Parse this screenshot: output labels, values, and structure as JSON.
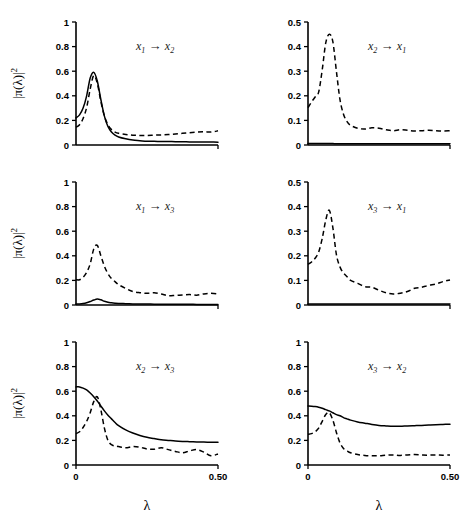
{
  "figure": {
    "xlabel": "λ",
    "ylabel_parts": {
      "bar": "|",
      "pi": "π(λ)",
      "bar2": "|",
      "exp": "2"
    },
    "arrow": "→"
  },
  "chart_data": [
    {
      "type": "line",
      "panel": "top-left",
      "title": "x1 → x2",
      "source": "x",
      "source_sub": "1",
      "target": "x",
      "target_sub": "2",
      "xlabel": "λ",
      "ylabel": "|π(λ)|²",
      "xlim": [
        0,
        0.5
      ],
      "ylim": [
        0,
        1
      ],
      "xticks": [
        0,
        0.5
      ],
      "xticklabels": [
        "0",
        "0.50"
      ],
      "yticks": [
        0,
        0.2,
        0.4,
        0.6,
        0.8,
        1
      ],
      "yticklabels": [
        "0",
        "0.2",
        "0.4",
        "0.6",
        "0.8",
        "1"
      ],
      "grid": false,
      "legend": false,
      "x": [
        0,
        0.0125,
        0.025,
        0.0375,
        0.05,
        0.0625,
        0.075,
        0.0875,
        0.1,
        0.1125,
        0.125,
        0.1375,
        0.15,
        0.175,
        0.2,
        0.225,
        0.25,
        0.275,
        0.3,
        0.325,
        0.35,
        0.375,
        0.4,
        0.425,
        0.45,
        0.475,
        0.5
      ],
      "series": [
        {
          "name": "solid",
          "style": "solid",
          "values": [
            0.22,
            0.245,
            0.3,
            0.4,
            0.545,
            0.59,
            0.52,
            0.37,
            0.235,
            0.15,
            0.105,
            0.08,
            0.065,
            0.05,
            0.04,
            0.035,
            0.03,
            0.03,
            0.028,
            0.028,
            0.027,
            0.026,
            0.025,
            0.025,
            0.024,
            0.024,
            0.023
          ]
        },
        {
          "name": "dashed",
          "style": "dashed",
          "values": [
            0.145,
            0.165,
            0.215,
            0.305,
            0.455,
            0.565,
            0.5,
            0.355,
            0.235,
            0.165,
            0.125,
            0.105,
            0.095,
            0.085,
            0.08,
            0.078,
            0.078,
            0.08,
            0.082,
            0.085,
            0.09,
            0.095,
            0.1,
            0.105,
            0.108,
            0.105,
            0.115
          ]
        }
      ]
    },
    {
      "type": "line",
      "panel": "top-right",
      "title": "x2 → x1",
      "source": "x",
      "source_sub": "2",
      "target": "x",
      "target_sub": "1",
      "xlabel": "λ",
      "ylabel": "",
      "xlim": [
        0,
        0.5
      ],
      "ylim": [
        0,
        0.5
      ],
      "xticks": [
        0,
        0.5
      ],
      "xticklabels": [
        "0",
        "0.50"
      ],
      "yticks": [
        0,
        0.1,
        0.2,
        0.3,
        0.4,
        0.5
      ],
      "yticklabels": [
        "0",
        "0.1",
        "0.2",
        "0.3",
        "0.4",
        "0.5"
      ],
      "grid": false,
      "legend": false,
      "x": [
        0,
        0.0125,
        0.025,
        0.0375,
        0.05,
        0.0625,
        0.075,
        0.0875,
        0.1,
        0.1125,
        0.125,
        0.1375,
        0.15,
        0.175,
        0.2,
        0.225,
        0.25,
        0.275,
        0.3,
        0.325,
        0.35,
        0.375,
        0.4,
        0.425,
        0.45,
        0.475,
        0.5
      ],
      "series": [
        {
          "name": "dashed",
          "style": "dashed",
          "values": [
            0.152,
            0.175,
            0.195,
            0.215,
            0.305,
            0.415,
            0.45,
            0.42,
            0.3,
            0.185,
            0.125,
            0.095,
            0.08,
            0.068,
            0.065,
            0.07,
            0.068,
            0.062,
            0.058,
            0.062,
            0.06,
            0.057,
            0.058,
            0.06,
            0.058,
            0.057,
            0.058
          ]
        },
        {
          "name": "solid",
          "style": "solid",
          "values": [
            0.006,
            0.006,
            0.006,
            0.006,
            0.006,
            0.006,
            0.006,
            0.006,
            0.005,
            0.005,
            0.005,
            0.005,
            0.005,
            0.005,
            0.005,
            0.005,
            0.005,
            0.005,
            0.005,
            0.005,
            0.005,
            0.005,
            0.005,
            0.005,
            0.005,
            0.005,
            0.005
          ]
        }
      ]
    },
    {
      "type": "line",
      "panel": "middle-left",
      "title": "x1 → x3",
      "source": "x",
      "source_sub": "1",
      "target": "x",
      "target_sub": "3",
      "xlabel": "λ",
      "ylabel": "|π(λ)|²",
      "xlim": [
        0,
        0.5
      ],
      "ylim": [
        0,
        1
      ],
      "xticks": [
        0,
        0.5
      ],
      "xticklabels": [
        "0",
        "0.50"
      ],
      "yticks": [
        0,
        0.2,
        0.4,
        0.6,
        0.8,
        1
      ],
      "yticklabels": [
        "0",
        "0.2",
        "0.4",
        "0.6",
        "0.8",
        "1"
      ],
      "grid": false,
      "legend": false,
      "x": [
        0,
        0.0125,
        0.025,
        0.0375,
        0.05,
        0.0625,
        0.075,
        0.0875,
        0.1,
        0.1125,
        0.125,
        0.1375,
        0.15,
        0.175,
        0.2,
        0.225,
        0.25,
        0.275,
        0.3,
        0.325,
        0.35,
        0.375,
        0.4,
        0.425,
        0.45,
        0.475,
        0.5
      ],
      "series": [
        {
          "name": "dashed",
          "style": "dashed",
          "values": [
            0.205,
            0.205,
            0.225,
            0.265,
            0.335,
            0.455,
            0.485,
            0.4,
            0.315,
            0.255,
            0.215,
            0.19,
            0.165,
            0.135,
            0.11,
            0.1,
            0.095,
            0.1,
            0.09,
            0.075,
            0.078,
            0.082,
            0.085,
            0.08,
            0.09,
            0.095,
            0.09
          ]
        },
        {
          "name": "solid",
          "style": "solid",
          "values": [
            0.008,
            0.009,
            0.012,
            0.018,
            0.028,
            0.04,
            0.048,
            0.042,
            0.03,
            0.022,
            0.018,
            0.015,
            0.013,
            0.011,
            0.009,
            0.008,
            0.008,
            0.007,
            0.007,
            0.006,
            0.006,
            0.006,
            0.006,
            0.005,
            0.005,
            0.005,
            0.005
          ]
        }
      ]
    },
    {
      "type": "line",
      "panel": "middle-right",
      "title": "x3 → x1",
      "source": "x",
      "source_sub": "3",
      "target": "x",
      "target_sub": "1",
      "xlabel": "λ",
      "ylabel": "",
      "xlim": [
        0,
        0.5
      ],
      "ylim": [
        0,
        0.5
      ],
      "xticks": [
        0,
        0.5
      ],
      "xticklabels": [
        "0",
        "0.50"
      ],
      "yticks": [
        0,
        0.1,
        0.2,
        0.3,
        0.4,
        0.5
      ],
      "yticklabels": [
        "0",
        "0.1",
        "0.2",
        "0.3",
        "0.4",
        "0.5"
      ],
      "grid": false,
      "legend": false,
      "x": [
        0,
        0.0125,
        0.025,
        0.0375,
        0.05,
        0.0625,
        0.075,
        0.0875,
        0.1,
        0.1125,
        0.125,
        0.1375,
        0.15,
        0.175,
        0.2,
        0.225,
        0.25,
        0.275,
        0.3,
        0.325,
        0.35,
        0.375,
        0.4,
        0.425,
        0.45,
        0.475,
        0.5
      ],
      "series": [
        {
          "name": "dashed",
          "style": "dashed",
          "values": [
            0.165,
            0.175,
            0.19,
            0.215,
            0.27,
            0.345,
            0.385,
            0.315,
            0.205,
            0.155,
            0.13,
            0.115,
            0.1,
            0.088,
            0.075,
            0.072,
            0.06,
            0.05,
            0.045,
            0.048,
            0.055,
            0.068,
            0.072,
            0.08,
            0.085,
            0.095,
            0.102
          ]
        },
        {
          "name": "solid",
          "style": "solid",
          "values": [
            0.004,
            0.004,
            0.004,
            0.004,
            0.004,
            0.004,
            0.004,
            0.004,
            0.004,
            0.004,
            0.004,
            0.004,
            0.004,
            0.004,
            0.004,
            0.004,
            0.004,
            0.004,
            0.004,
            0.004,
            0.004,
            0.004,
            0.004,
            0.004,
            0.004,
            0.004,
            0.004
          ]
        }
      ]
    },
    {
      "type": "line",
      "panel": "bottom-left",
      "title": "x2 → x3",
      "source": "x",
      "source_sub": "2",
      "target": "x",
      "target_sub": "3",
      "xlabel": "λ",
      "ylabel": "|π(λ)|²",
      "xlim": [
        0,
        0.5
      ],
      "ylim": [
        0,
        1
      ],
      "xticks": [
        0,
        0.5
      ],
      "xticklabels": [
        "0",
        "0.50"
      ],
      "yticks": [
        0,
        0.2,
        0.4,
        0.6,
        0.8,
        1
      ],
      "yticklabels": [
        "0",
        "0.2",
        "0.4",
        "0.6",
        "0.8",
        "1"
      ],
      "grid": false,
      "legend": false,
      "x": [
        0,
        0.0125,
        0.025,
        0.0375,
        0.05,
        0.0625,
        0.075,
        0.0875,
        0.1,
        0.1125,
        0.125,
        0.1375,
        0.15,
        0.175,
        0.2,
        0.225,
        0.25,
        0.275,
        0.3,
        0.325,
        0.35,
        0.375,
        0.4,
        0.425,
        0.45,
        0.475,
        0.5
      ],
      "series": [
        {
          "name": "solid",
          "style": "solid",
          "values": [
            0.635,
            0.635,
            0.625,
            0.61,
            0.585,
            0.555,
            0.52,
            0.48,
            0.44,
            0.405,
            0.375,
            0.345,
            0.32,
            0.285,
            0.26,
            0.24,
            0.225,
            0.215,
            0.205,
            0.2,
            0.195,
            0.192,
            0.19,
            0.188,
            0.186,
            0.185,
            0.185
          ]
        },
        {
          "name": "dashed",
          "style": "dashed",
          "values": [
            0.255,
            0.27,
            0.305,
            0.355,
            0.425,
            0.515,
            0.555,
            0.45,
            0.3,
            0.2,
            0.165,
            0.155,
            0.15,
            0.14,
            0.15,
            0.145,
            0.13,
            0.128,
            0.14,
            0.125,
            0.11,
            0.1,
            0.115,
            0.125,
            0.105,
            0.075,
            0.09
          ]
        }
      ]
    },
    {
      "type": "line",
      "panel": "bottom-right",
      "title": "x3 → x2",
      "source": "x",
      "source_sub": "3",
      "target": "x",
      "target_sub": "2",
      "xlabel": "λ",
      "ylabel": "",
      "xlim": [
        0,
        0.5
      ],
      "ylim": [
        0,
        1
      ],
      "xticks": [
        0,
        0.5
      ],
      "xticklabels": [
        "0",
        "0.50"
      ],
      "yticks": [
        0,
        0.2,
        0.4,
        0.6,
        0.8,
        1
      ],
      "yticklabels": [
        "0",
        "0.2",
        "0.4",
        "0.6",
        "0.8",
        "1"
      ],
      "grid": false,
      "legend": false,
      "x": [
        0,
        0.0125,
        0.025,
        0.0375,
        0.05,
        0.0625,
        0.075,
        0.0875,
        0.1,
        0.1125,
        0.125,
        0.1375,
        0.15,
        0.175,
        0.2,
        0.225,
        0.25,
        0.275,
        0.3,
        0.325,
        0.35,
        0.375,
        0.4,
        0.425,
        0.45,
        0.475,
        0.5
      ],
      "series": [
        {
          "name": "solid",
          "style": "solid",
          "values": [
            0.48,
            0.478,
            0.475,
            0.47,
            0.462,
            0.45,
            0.44,
            0.425,
            0.41,
            0.4,
            0.385,
            0.375,
            0.365,
            0.35,
            0.34,
            0.33,
            0.322,
            0.318,
            0.315,
            0.315,
            0.318,
            0.32,
            0.322,
            0.325,
            0.328,
            0.33,
            0.332
          ]
        },
        {
          "name": "dashed",
          "style": "dashed",
          "values": [
            0.25,
            0.255,
            0.27,
            0.3,
            0.355,
            0.41,
            0.425,
            0.365,
            0.265,
            0.18,
            0.135,
            0.115,
            0.1,
            0.085,
            0.078,
            0.075,
            0.075,
            0.08,
            0.082,
            0.078,
            0.082,
            0.085,
            0.082,
            0.08,
            0.082,
            0.08,
            0.082
          ]
        }
      ]
    }
  ]
}
